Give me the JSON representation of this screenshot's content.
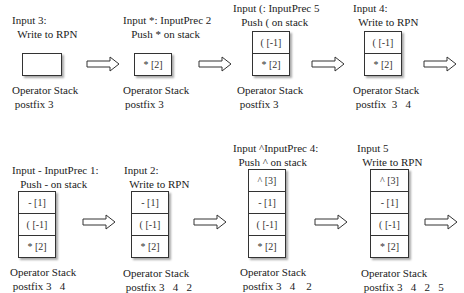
{
  "steps": [
    {
      "line1": "Input 3:",
      "line2": "  Write to RPN",
      "stack": [],
      "caption": "Operator Stack",
      "postfix": " postfix 3"
    },
    {
      "line1": "Input *: InputPrec 2",
      "line2": "   Push * on stack",
      "stack": [
        "* [2]"
      ],
      "caption": "Operator Stack",
      "postfix": "postfix 3"
    },
    {
      "line1": "Input (: InputPrec 5",
      "line2": "   Push ( on stack",
      "stack": [
        "( [-1]",
        "* [2]"
      ],
      "caption": "Operator Stack",
      "postfix": " postfix 3"
    },
    {
      "line1": "Input 4:",
      "line2": "  Write to RPN",
      "stack": [
        "( [-1]",
        "* [2]"
      ],
      "caption": "Operator Stack",
      "postfix": " postfix  3   4"
    },
    {
      "line1": "Input - InputPrec 1:",
      "line2": "   Push - on stack",
      "stack": [
        "- [1]",
        "( [-1]",
        "* [2]"
      ],
      "caption": "Operator Stack",
      "postfix": " postfix 3   4"
    },
    {
      "line1": "Input 2:",
      "line2": "  Write to RPN",
      "stack": [
        "- [1]",
        "( [-1]",
        "* [2]"
      ],
      "caption": "Operator Stack",
      "postfix": " postfix 3   4   2"
    },
    {
      "line1": "Input ^InputPrec 4:",
      "line2": "  Push ^ on stack",
      "stack": [
        "^ [3]",
        "- [1]",
        "( [-1]",
        "* [2]"
      ],
      "caption": "Operator Stack",
      "postfix": " postfix 3   4    2"
    },
    {
      "line1": "Input 5",
      "line2": "  Write to RPN",
      "stack": [
        "^ [3]",
        "- [1]",
        "( [-1]",
        "* [2]"
      ],
      "caption": "Operator Stack",
      "postfix": " postfix 3   4   2   5"
    }
  ]
}
